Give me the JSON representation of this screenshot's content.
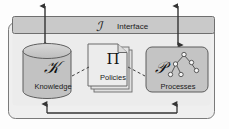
{
  "diagram": {
    "colors": {
      "outer_fill": "#efefef",
      "bar_fill": "#c9c9c9",
      "cylinder_fill": "#c2c2c2",
      "doc_fill": "#e4e4e4",
      "box_fill": "#c4c4c4",
      "stroke": "#555555",
      "text": "#1d1d1d"
    },
    "interface": {
      "symbol": "ℐ",
      "label": "Interface"
    },
    "nodes": [
      {
        "id": "knowledge",
        "shape": "cylinder",
        "symbol": "𝒦",
        "label": "Knowledge"
      },
      {
        "id": "policies",
        "shape": "document-stack",
        "symbol": "Π",
        "label": "Policies"
      },
      {
        "id": "processes",
        "shape": "rounded-rect",
        "symbol": "𝒫",
        "label": "Processes"
      }
    ],
    "connectors": [
      {
        "id": "knowledge-to-interface",
        "style": "double-arrow",
        "orientation": "vertical"
      },
      {
        "id": "processes-to-interface",
        "style": "double-arrow",
        "orientation": "vertical"
      },
      {
        "id": "knowledge-policies",
        "style": "dashed"
      },
      {
        "id": "policies-processes",
        "style": "dashed"
      },
      {
        "id": "knowledge-processes-feedback",
        "style": "u-shaped-double-arrow"
      }
    ]
  }
}
